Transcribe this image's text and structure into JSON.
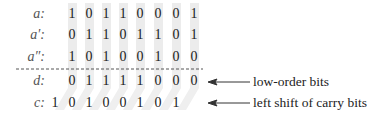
{
  "rows": [
    {
      "label": "a:",
      "bits": [
        "1",
        "0",
        "1",
        "1",
        "0",
        "0",
        "0",
        "1"
      ]
    },
    {
      "label": "a′:",
      "bits": [
        "0",
        "1",
        "1",
        "0",
        "1",
        "1",
        "0",
        "1"
      ]
    },
    {
      "label": "a″:",
      "bits": [
        "1",
        "0",
        "1",
        "0",
        "0",
        "1",
        "0",
        "0"
      ]
    },
    {
      "label": "d:",
      "bits": [
        "0",
        "1",
        "1",
        "1",
        "1",
        "0",
        "0",
        "0"
      ]
    },
    {
      "label": "c:",
      "bits": [
        "1",
        "0",
        "1",
        "0",
        "0",
        "1",
        "0",
        "1"
      ]
    }
  ],
  "annotations": {
    "low_order": "low-order bits",
    "carry": "left shift of carry bits"
  },
  "colors": {
    "shade": "#ececec",
    "text": "#222222",
    "label": "#555555"
  }
}
